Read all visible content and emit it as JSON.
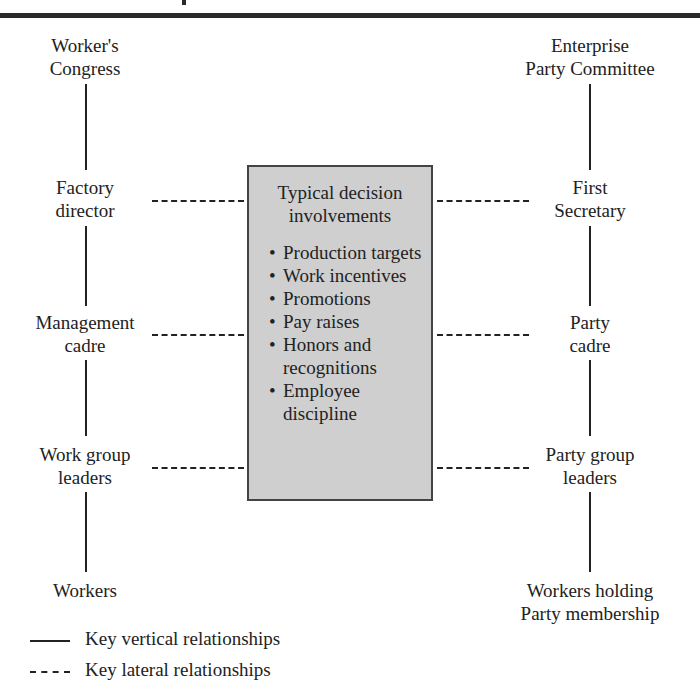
{
  "left_column": [
    {
      "label": "Worker's\nCongress"
    },
    {
      "label": "Factory\ndirector"
    },
    {
      "label": "Management\ncadre"
    },
    {
      "label": "Work group\nleaders"
    },
    {
      "label": "Workers"
    }
  ],
  "right_column": [
    {
      "label": "Enterprise\nParty Committee"
    },
    {
      "label": "First\nSecretary"
    },
    {
      "label": "Party\ncadre"
    },
    {
      "label": "Party group\nleaders"
    },
    {
      "label": "Workers holding\nParty membership"
    }
  ],
  "center_box": {
    "title": "Typical decision involvements",
    "items": [
      "Production targets",
      "Work incentives",
      "Promotions",
      "Pay raises",
      "Honors and recognitions",
      "Employee discipline"
    ]
  },
  "legend": {
    "vertical": "Key vertical relationships",
    "lateral": "Key lateral relationships"
  }
}
